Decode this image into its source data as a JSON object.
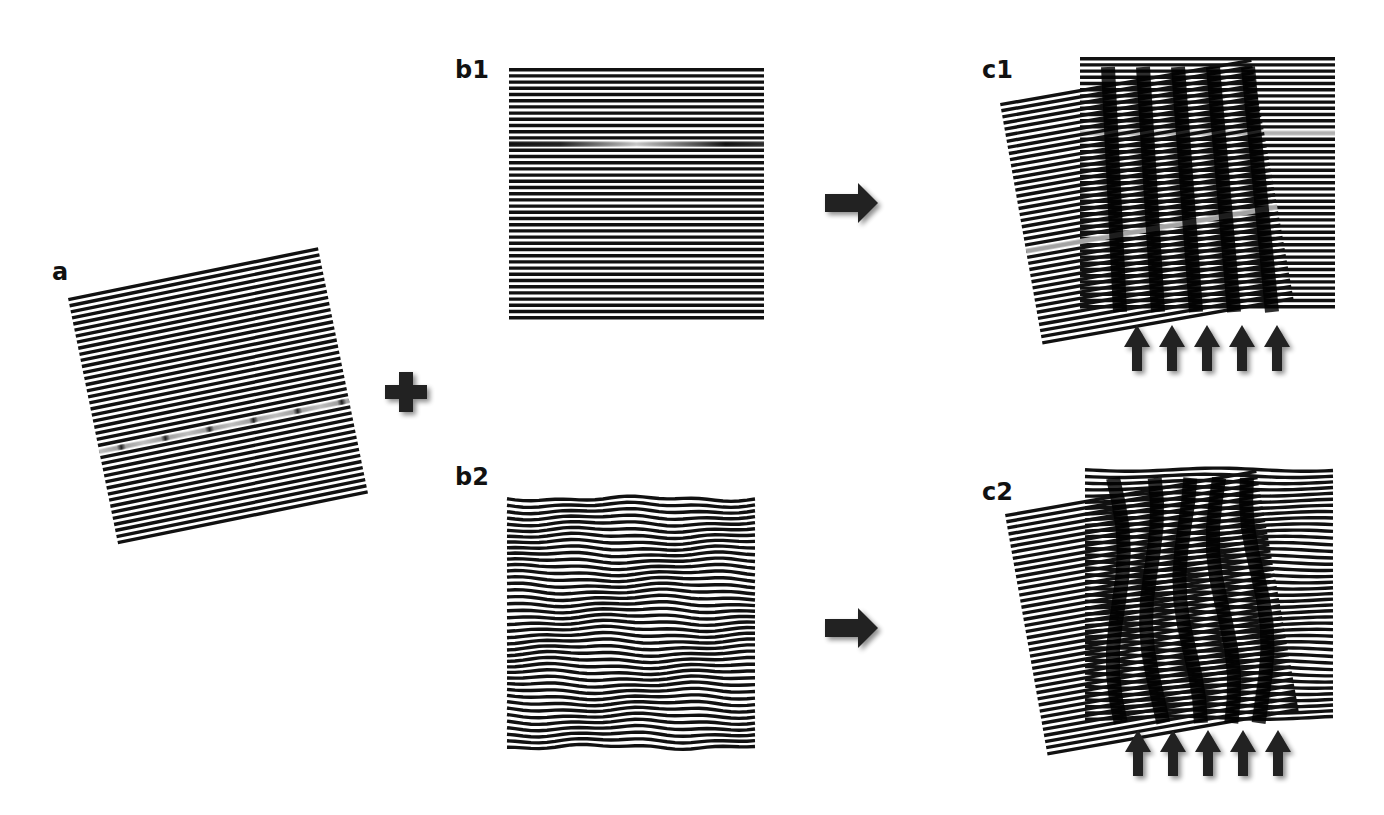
{
  "figure": {
    "colors": {
      "line": "#111111",
      "background": "#ffffff",
      "defect": "#d9d9d9",
      "symbol": "#222222"
    },
    "panels": {
      "a": {
        "label": "a",
        "content": "rotated line grating with a dislocation defect line"
      },
      "b1": {
        "label": "b1",
        "content": "straight horizontal line grating with a defect line"
      },
      "b2": {
        "label": "b2",
        "content": "wavy (distorted) horizontal line grating"
      },
      "c1": {
        "label": "c1",
        "content": "superposition of a and b1 producing straight moire fringes",
        "arrow_count": 5
      },
      "c2": {
        "label": "c2",
        "content": "superposition of a and b2 producing distorted moire fringes",
        "arrow_count": 5
      }
    },
    "symbols": {
      "plus": "plus-icon",
      "arrow_right": "arrow-right-icon",
      "arrow_up": "arrow-up-icon"
    }
  }
}
